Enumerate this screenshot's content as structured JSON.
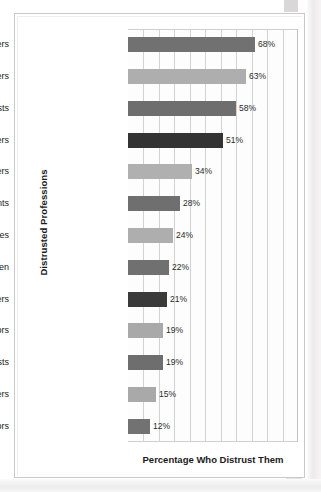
{
  "chart_data": {
    "type": "bar",
    "orientation": "horizontal",
    "title": "",
    "xlabel": "Percentage Who Distrust Them",
    "ylabel": "Distrusted Professions",
    "xlim": [
      0,
      91
    ],
    "grid": true,
    "legend": false,
    "gridline_count": 10,
    "value_suffix": "%",
    "categories": [
      "Lawyers",
      "Congressional members",
      "Journalists",
      "T.V. newscasters",
      "Bankers",
      "Accountants",
      "Judges",
      "Clergymen",
      "Police officers",
      "Professors",
      "Scientists",
      "Teachers",
      "Doctors"
    ],
    "values": [
      68,
      63,
      58,
      51,
      34,
      28,
      24,
      22,
      21,
      19,
      19,
      15,
      12
    ],
    "value_labels": [
      "68%",
      "63%",
      "58%",
      "51%",
      "34%",
      "28%",
      "24%",
      "22%",
      "21%",
      "19%",
      "19%",
      "15%",
      "12%"
    ],
    "bar_colors": [
      "#717171",
      "#aeaeae",
      "#6e6e6e",
      "#333333",
      "#b0b0b0",
      "#6f6f6f",
      "#aeaeae",
      "#707070",
      "#3a3a3a",
      "#a9a9a9",
      "#6e6e6e",
      "#a9a9a9",
      "#727272"
    ]
  },
  "colors": {
    "frame": "#c9c9c9",
    "grid": "#d2d2d2",
    "text": "#1b1b1b",
    "plot_background": "#fdfdfd"
  }
}
